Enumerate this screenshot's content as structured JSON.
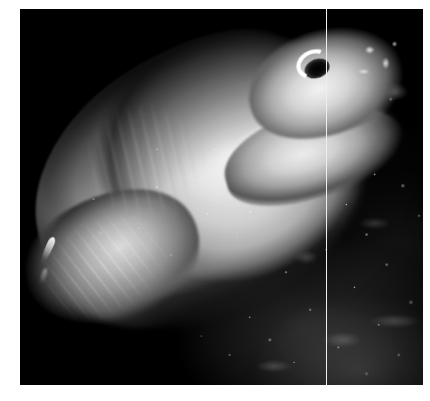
{
  "image": {
    "kind": "photograph",
    "subject": "fish",
    "caption": "",
    "orientation": "landscape",
    "frame": {
      "canvas_width": 430,
      "canvas_height": 401,
      "photo_left": 20,
      "photo_top": 9,
      "photo_width": 403,
      "photo_height": 376,
      "matte_color": "#ffffff"
    },
    "palette": {
      "background_black": "#000000",
      "body_highlight": "#f4f4f4",
      "body_midtone": "#b0b0b0",
      "body_shadow": "#3c3c3c",
      "seafloor_speckle": "#d7d7d7",
      "scan_artifact": "#ebebeb"
    },
    "scene": {
      "setting": "dark underwater seabed at night",
      "lighting": "single strong artificial strobe from the left/front",
      "background_description": "near-black open water filling the upper-left half of the frame",
      "floor_description": "dark gravel and sediment seabed with scattered bright speckles across the lower-right quadrant"
    },
    "subject_detail": {
      "pose": "body runs diagonally from lower-left tail to upper-right head, tilted about 26 degrees",
      "body_description": "pale elongated torpedo-shaped body brightly lit, nearly white along the flank and fading to black along the dorsal edge",
      "head_description": "blunt pale snout at upper right with small bright highlight spots",
      "eye_description": "dark round eye with a bright white crescent highlight along its upper-left rim",
      "fin_description": "large pale pectoral flipper curving below and behind the head",
      "markings_description": "faint diagonal striations and banding across the mid-upper flank",
      "tail_description": "tapering caudal section at lower left with streaky light rays",
      "extra_element": "small bright sliver of a separate fin or small fish at the lower left, away from the main body"
    },
    "artifacts": {
      "scan_line": "faint pale vertical line running the full height of the photo at about x=326",
      "grain": "visible monochrome film grain throughout"
    }
  }
}
